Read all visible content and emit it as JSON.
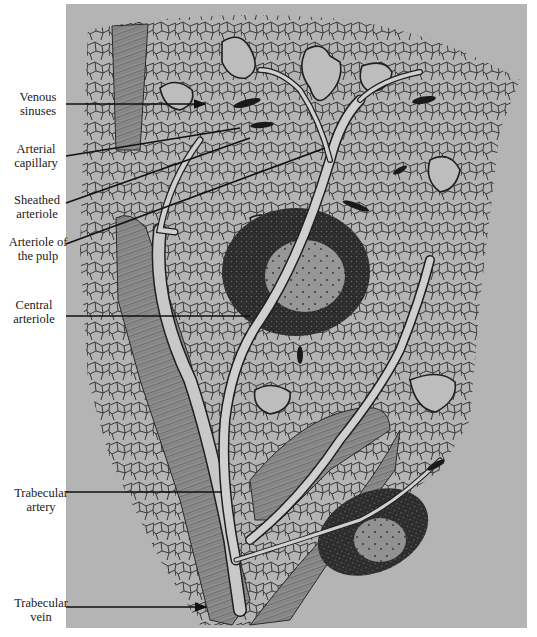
{
  "figure": {
    "background_color": "#b4b4b4",
    "ink_color": "#1f1f1f",
    "labels": [
      {
        "id": "venous-sinuses",
        "line1": "Venous",
        "line2": "sinuses"
      },
      {
        "id": "arterial-capillary",
        "line1": "Arterial",
        "line2": "capillary"
      },
      {
        "id": "sheathed-arteriole",
        "line1": "Sheathed",
        "line2": "arteriole"
      },
      {
        "id": "arteriole-of-the-pulp",
        "line1": "Arteriole of",
        "line2": "the pulp"
      },
      {
        "id": "central-arteriole",
        "line1": "Central",
        "line2": "arteriole"
      },
      {
        "id": "trabecular-artery",
        "line1": "Trabecular",
        "line2": "artery"
      },
      {
        "id": "trabecular-vein",
        "line1": "Trabecular",
        "line2": "vein"
      }
    ],
    "structures": [
      "red pulp reticular network",
      "venous sinuses",
      "white pulp follicle (large)",
      "white pulp follicle (small)",
      "trabeculae",
      "central artery branches"
    ]
  }
}
